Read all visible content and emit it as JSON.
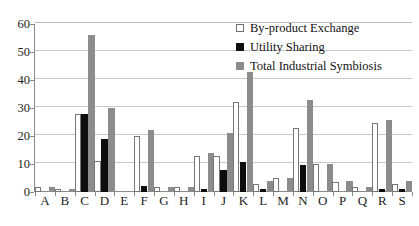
{
  "chart_data": {
    "type": "bar",
    "title": "",
    "xlabel": "",
    "ylabel": "",
    "ylim": [
      0,
      60
    ],
    "yticks": [
      0,
      10,
      20,
      30,
      40,
      50,
      60
    ],
    "grid": true,
    "legend_position": "top-right",
    "categories": [
      "A",
      "B",
      "C",
      "D",
      "E",
      "F",
      "G",
      "H",
      "I",
      "J",
      "K",
      "L",
      "M",
      "N",
      "O",
      "P",
      "Q",
      "R",
      "S"
    ],
    "series": [
      {
        "name": "By-product Exchange",
        "color": "#ffffff",
        "values": [
          1.8,
          1.0,
          28.0,
          11.0,
          0.0,
          20.0,
          1.8,
          1.8,
          12.8,
          12.8,
          32.0,
          3.0,
          5.0,
          22.8,
          10.0,
          3.6,
          1.8,
          24.6,
          2.8
        ]
      },
      {
        "name": "Utility Sharing",
        "color": "#0d0d0d",
        "values": [
          0.0,
          0.0,
          28.0,
          19.0,
          0.0,
          2.2,
          0.0,
          0.0,
          1.2,
          8.0,
          10.8,
          1.0,
          0.0,
          9.8,
          0.0,
          0.0,
          0.0,
          1.0,
          1.0
        ]
      },
      {
        "name": "Total Industrial Symbiosis",
        "color": "#8c8c8c",
        "values": [
          1.8,
          1.0,
          56.0,
          30.0,
          0.0,
          22.0,
          1.8,
          1.8,
          14.0,
          21.0,
          43.0,
          4.0,
          5.0,
          32.8,
          10.0,
          3.8,
          1.8,
          25.6,
          4.0
        ]
      }
    ]
  },
  "legend": {
    "items": [
      {
        "label": "By-product Exchange",
        "swatch": "open-square-icon",
        "series_class": "series-byproduct"
      },
      {
        "label": "Utility Sharing",
        "swatch": "filled-black-square-icon",
        "series_class": "series-utility"
      },
      {
        "label": "Total Industrial Symbiosis",
        "swatch": "filled-gray-square-icon",
        "series_class": "series-total"
      }
    ]
  }
}
